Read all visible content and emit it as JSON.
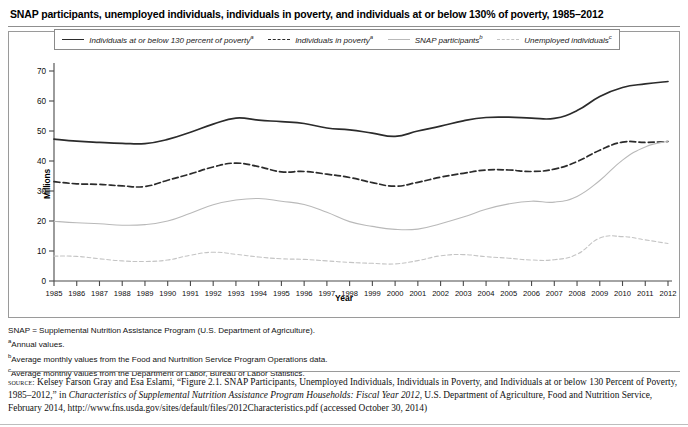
{
  "figure": {
    "title": "SNAP participants, unemployed individuals, individuals in poverty, and individuals at or below 130% of poverty, 1985–2012"
  },
  "legend": {
    "items": [
      {
        "label": "Individuals at or below 130 percent of poverty",
        "marker": "a",
        "style": "solid",
        "color": "#2b2b2b"
      },
      {
        "label": "Individuals in poverty",
        "marker": "a",
        "style": "dashed",
        "color": "#2b2b2b"
      },
      {
        "label": "SNAP participants",
        "marker": "b",
        "style": "thin",
        "color": "#b9b9b9"
      },
      {
        "label": "Unemployed individuals",
        "marker": "c",
        "style": "dotted",
        "color": "#c4c4c4"
      }
    ]
  },
  "axes": {
    "y_title": "Millions",
    "x_title": "Year",
    "y_ticks": [
      "0",
      "10",
      "20",
      "30",
      "40",
      "50",
      "60",
      "70"
    ]
  },
  "notes": {
    "lines": [
      {
        "text": "SNAP = Supplemental Nutrition Assistance Program (U.S. Department of Agriculture).",
        "marker": ""
      },
      {
        "text": "Annual values.",
        "marker": "a"
      },
      {
        "text": "Average monthly values from the Food and Nurtnition Service Program Operations data.",
        "marker": "b"
      },
      {
        "text": "Average monthly values from the Department of Labor, Bureau of Labor Statistics.",
        "marker": "c"
      }
    ]
  },
  "source": {
    "label": "source:",
    "part1": " Kelsey Farson Gray and Esa Eslami, “Figure 2.1. SNAP Participants, Unemployed Individuals, Individuals in Poverty, and Individuals at or below 130 Percent of Poverty, 1985–2012,” in ",
    "italic": "Characteristics of Supplemental Nutrition Assistance Program Households: Fiscal Year 2012",
    "part2": ", U.S. Department of Agriculture, Food and Nutrition Service, February 2014, http://www.fns.usda.gov/sites/default/files/2012Characteristics.pdf (accessed October 30, 2014)"
  },
  "chart_data": {
    "type": "line",
    "title": "SNAP participants, unemployed individuals, individuals in poverty, and individuals at or below 130% of poverty, 1985–2012",
    "xlabel": "Year",
    "ylabel": "Millions",
    "ylim": [
      0,
      70
    ],
    "xlim": [
      1985,
      2012
    ],
    "grid": false,
    "legend_position": "top",
    "x": [
      1985,
      1986,
      1987,
      1988,
      1989,
      1990,
      1991,
      1992,
      1993,
      1994,
      1995,
      1996,
      1997,
      1998,
      1999,
      2000,
      2001,
      2002,
      2003,
      2004,
      2005,
      2006,
      2007,
      2008,
      2009,
      2010,
      2011,
      2012
    ],
    "series": [
      {
        "name": "Individuals at or below 130 percent of poverty",
        "style": "solid",
        "color": "#2b2b2b",
        "values": [
          47.3,
          46.6,
          46.2,
          45.9,
          45.8,
          47.2,
          49.6,
          52.3,
          54.3,
          53.6,
          53.1,
          52.5,
          51.0,
          50.4,
          49.3,
          48.2,
          50.0,
          51.6,
          53.4,
          54.5,
          54.6,
          54.3,
          54.2,
          56.8,
          61.5,
          64.5,
          65.7,
          66.5
        ]
      },
      {
        "name": "Individuals in poverty",
        "style": "dashed",
        "color": "#2b2b2b",
        "values": [
          33.1,
          32.4,
          32.2,
          31.7,
          31.5,
          33.6,
          35.7,
          38.0,
          39.3,
          38.1,
          36.4,
          36.5,
          35.6,
          34.5,
          32.8,
          31.6,
          32.9,
          34.6,
          35.9,
          37.0,
          37.0,
          36.5,
          37.3,
          39.8,
          43.6,
          46.3,
          46.2,
          46.5
        ]
      },
      {
        "name": "SNAP participants",
        "style": "thin",
        "color": "#b9b9b9",
        "values": [
          19.9,
          19.4,
          19.1,
          18.6,
          18.8,
          20.0,
          22.6,
          25.4,
          27.0,
          27.5,
          26.6,
          25.5,
          22.9,
          19.8,
          18.2,
          17.2,
          17.3,
          19.1,
          21.3,
          23.9,
          25.7,
          26.6,
          26.3,
          28.2,
          33.5,
          40.3,
          44.7,
          46.6
        ]
      },
      {
        "name": "Unemployed individuals",
        "style": "dotted",
        "color": "#c4c4c4",
        "values": [
          8.3,
          8.2,
          7.4,
          6.7,
          6.5,
          7.0,
          8.6,
          9.6,
          8.9,
          8.0,
          7.4,
          7.2,
          6.7,
          6.2,
          5.9,
          5.7,
          6.8,
          8.4,
          8.8,
          8.1,
          7.6,
          7.0,
          7.1,
          8.9,
          14.3,
          14.8,
          13.7,
          12.5
        ]
      }
    ]
  }
}
